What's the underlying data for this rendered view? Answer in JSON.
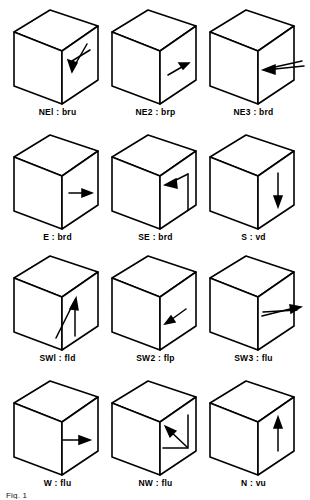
{
  "figure": {
    "stroke_color": "#000000",
    "face_color": "#ffffff",
    "background": "#ffffff",
    "grid": {
      "rows": 4,
      "cols": 3
    },
    "caption_stub": "Fig. 1"
  },
  "cells": [
    {
      "id": "ne1",
      "label": "NEl : bru",
      "code": "NEl",
      "abbrev": "bru",
      "row": 0,
      "col": 0,
      "arrow_name": "arrow-down-left-with-diagonal-tail"
    },
    {
      "id": "ne2",
      "label": "NE2 : brp",
      "code": "NE2",
      "abbrev": "brp",
      "row": 0,
      "col": 1,
      "arrow_name": "arrow-up-right-short"
    },
    {
      "id": "ne3",
      "label": "NE3 : brd",
      "code": "NE3",
      "abbrev": "brd",
      "row": 0,
      "col": 2,
      "arrow_name": "arrow-left-overhanging-double"
    },
    {
      "id": "e",
      "label": "E : brd",
      "code": "E",
      "abbrev": "brd",
      "row": 1,
      "col": 0,
      "arrow_name": "arrow-right-horizontal"
    },
    {
      "id": "se",
      "label": "SE : brd",
      "code": "SE",
      "abbrev": "brd",
      "row": 1,
      "col": 1,
      "arrow_name": "arrow-up-left-with-vertical-tail"
    },
    {
      "id": "s",
      "label": "S : vd",
      "code": "S",
      "abbrev": "vd",
      "row": 1,
      "col": 2,
      "arrow_name": "arrow-down-vertical"
    },
    {
      "id": "sw1",
      "label": "SWl : fld",
      "code": "SWl",
      "abbrev": "fld",
      "row": 2,
      "col": 0,
      "arrow_name": "arrow-up-right-with-vertical-tail"
    },
    {
      "id": "sw2",
      "label": "SW2 : flp",
      "code": "SW2",
      "abbrev": "flp",
      "row": 2,
      "col": 1,
      "arrow_name": "arrow-down-left-short"
    },
    {
      "id": "sw3",
      "label": "SW3 : flu",
      "code": "SW3",
      "abbrev": "flu",
      "row": 2,
      "col": 2,
      "arrow_name": "arrow-right-overhanging-double"
    },
    {
      "id": "w",
      "label": "W : flu",
      "code": "W",
      "abbrev": "flu",
      "row": 3,
      "col": 0,
      "arrow_name": "arrow-right-horizontal-barbed"
    },
    {
      "id": "nw",
      "label": "NW : flu",
      "code": "NW",
      "abbrev": "flu",
      "row": 3,
      "col": 1,
      "arrow_name": "arrow-up-left-with-elbow-tail"
    },
    {
      "id": "n",
      "label": "N : vu",
      "code": "N",
      "abbrev": "vu",
      "row": 3,
      "col": 2,
      "arrow_name": "arrow-up-vertical"
    }
  ]
}
